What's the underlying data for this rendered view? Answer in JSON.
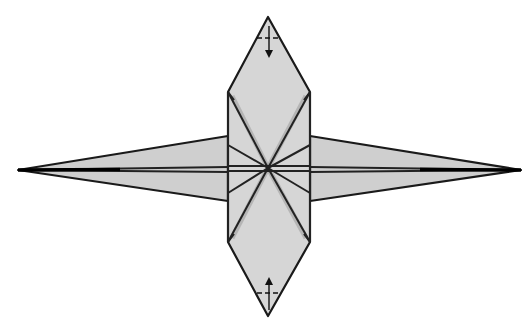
{
  "diagram": {
    "colors": {
      "paper": "#d6d6d6",
      "outline": "#1a1a1a",
      "background": "#ffffff"
    },
    "elements": {
      "top_point": {
        "x": 268,
        "y": 17
      },
      "bottom_point": {
        "x": 268,
        "y": 316
      },
      "left_spike_tip": {
        "x": 18,
        "y": 170
      },
      "right_spike_tip": {
        "x": 521,
        "y": 170
      },
      "center": {
        "x": 268,
        "y": 168
      },
      "center_panel": {
        "left": 228,
        "right": 310,
        "top": 92,
        "bottom": 242
      },
      "top_fold_line_y": 38,
      "bottom_fold_line_y": 293,
      "top_arrow": "fold-down-arrow",
      "bottom_arrow": "fold-up-arrow"
    },
    "labels": {
      "top_fold": "Valley fold top tip down",
      "bottom_fold": "Valley fold bottom tip up"
    }
  }
}
